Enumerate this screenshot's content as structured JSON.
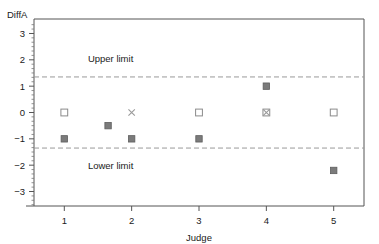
{
  "chart_data": {
    "type": "scatter",
    "title": "",
    "xlabel": "Judge",
    "ylabel": "DiffA",
    "xlim": [
      0.55,
      5.45
    ],
    "ylim": [
      -3.55,
      3.55
    ],
    "grid": false,
    "legend": "none",
    "x_ticks": [
      1,
      2,
      3,
      4,
      5
    ],
    "x_tick_labels": [
      "1",
      "2",
      "3",
      "4",
      "5"
    ],
    "y_ticks": [
      3,
      2,
      1,
      0,
      -1,
      -2,
      -3
    ],
    "y_tick_labels": [
      "3",
      "2",
      "1",
      "0",
      "−1",
      "−2",
      "−3"
    ],
    "annotations": [
      {
        "text": "Upper limit",
        "x": 1.35,
        "y": 2.05
      },
      {
        "text": "Lower limit",
        "x": 1.35,
        "y": -2.0
      }
    ],
    "reference_lines": [
      {
        "name": "upper-limit",
        "value": 1.35,
        "style": "dashed"
      },
      {
        "name": "lower-limit",
        "value": -1.35,
        "style": "dashed"
      }
    ],
    "series": [
      {
        "name": "open-square",
        "marker": "open-square",
        "points": [
          {
            "x": 1,
            "y": 0
          },
          {
            "x": 3,
            "y": 0
          },
          {
            "x": 4,
            "y": 0
          },
          {
            "x": 5,
            "y": 0
          }
        ]
      },
      {
        "name": "cross",
        "marker": "cross",
        "points": [
          {
            "x": 2,
            "y": 0
          },
          {
            "x": 4,
            "y": 0
          }
        ]
      },
      {
        "name": "filled-square",
        "marker": "filled-square",
        "points": [
          {
            "x": 1,
            "y": -1.0
          },
          {
            "x": 1.65,
            "y": -0.5
          },
          {
            "x": 2,
            "y": -1.0
          },
          {
            "x": 3,
            "y": -1.0
          },
          {
            "x": 4,
            "y": 1.0
          },
          {
            "x": 5,
            "y": -2.2
          }
        ]
      }
    ]
  },
  "labels": {
    "y_axis_title": "DiffA",
    "x_axis_title": "Judge",
    "upper_limit": "Upper limit",
    "lower_limit": "Lower limit"
  },
  "colors": {
    "marker_fill": "#7b7b7b",
    "marker_open_stroke": "#8a8a8a",
    "limit_line": "#9a9a9a",
    "axis": "#555555",
    "text": "#1a1a1a",
    "background": "#ffffff"
  }
}
